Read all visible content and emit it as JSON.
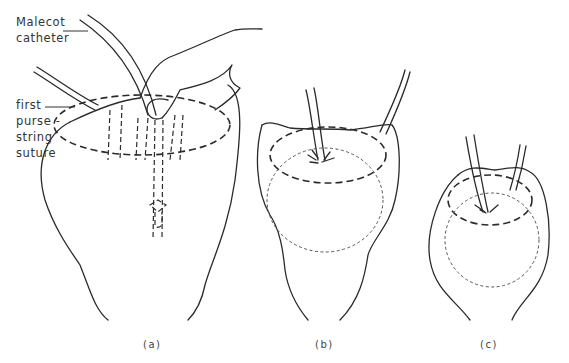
{
  "figure": {
    "labels": {
      "catheter_line1": "Malecot",
      "catheter_line2": "catheter",
      "suture_line1": "first",
      "suture_line2": "purse -",
      "suture_line3": "string",
      "suture_line4": "suture"
    },
    "panels": [
      {
        "id": "a",
        "caption": "(a)",
        "description": "Malecot catheter inserted through bladder wall, finger pressing, first purse-string suture shown dashed"
      },
      {
        "id": "b",
        "caption": "(b)",
        "description": "First purse-string tied around catheter, second purse-string suture placed"
      },
      {
        "id": "c",
        "caption": "(c)",
        "description": "Second purse-string tied, bladder inverted around catheter"
      }
    ],
    "colors": {
      "line": "#2a2a2a",
      "background": "#ffffff"
    }
  }
}
